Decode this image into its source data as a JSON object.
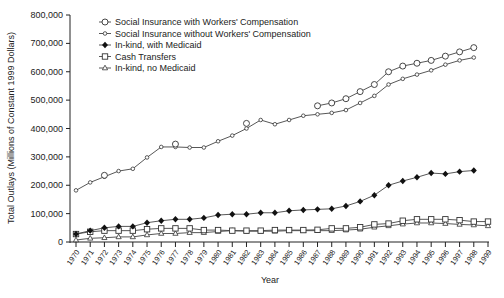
{
  "chart_data": {
    "type": "line",
    "title": "",
    "xlabel": "Year",
    "ylabel": "Total Outlays (Millions of Constant 1999 Dollars)",
    "ylim": [
      0,
      800000
    ],
    "yticks": [
      0,
      100000,
      200000,
      300000,
      400000,
      500000,
      600000,
      700000,
      800000
    ],
    "ytick_labels": [
      "0",
      "100,000",
      "200,000",
      "300,000",
      "400,000",
      "500,000",
      "600,000",
      "700,000",
      "800,000"
    ],
    "x": [
      1970,
      1971,
      1972,
      1973,
      1974,
      1975,
      1976,
      1977,
      1978,
      1979,
      1980,
      1981,
      1982,
      1983,
      1984,
      1985,
      1986,
      1987,
      1988,
      1989,
      1990,
      1991,
      1992,
      1993,
      1994,
      1995,
      1996,
      1997,
      1998,
      1999
    ],
    "grid": false,
    "legend_position": "upper-left",
    "series": [
      {
        "name": "Social Insurance with Workers' Compensation",
        "marker": "large-circle",
        "values": [
          null,
          null,
          235000,
          null,
          null,
          null,
          null,
          345000,
          null,
          null,
          null,
          null,
          418000,
          null,
          null,
          null,
          null,
          480000,
          490000,
          505000,
          530000,
          555000,
          600000,
          620000,
          630000,
          640000,
          655000,
          670000,
          685000,
          null
        ]
      },
      {
        "name": "Social Insurance without Workers' Compensation",
        "marker": "small-diamond",
        "values": [
          182000,
          210000,
          230000,
          250000,
          258000,
          298000,
          335000,
          335000,
          333000,
          333000,
          355000,
          375000,
          400000,
          430000,
          415000,
          430000,
          445000,
          450000,
          455000,
          465000,
          490000,
          515000,
          555000,
          575000,
          590000,
          605000,
          625000,
          640000,
          650000,
          null
        ]
      },
      {
        "name": "In-kind, with Medicaid",
        "marker": "filled-diamond",
        "values": [
          28000,
          40000,
          50000,
          55000,
          55000,
          68000,
          75000,
          80000,
          80000,
          85000,
          95000,
          98000,
          98000,
          103000,
          103000,
          110000,
          113000,
          115000,
          117000,
          127000,
          143000,
          165000,
          200000,
          215000,
          228000,
          243000,
          240000,
          248000,
          252000,
          null
        ]
      },
      {
        "name": "Cash Transfers",
        "marker": "square",
        "values": [
          28000,
          36000,
          40000,
          40000,
          40000,
          45000,
          48000,
          48000,
          48000,
          42000,
          42000,
          40000,
          40000,
          40000,
          42000,
          42000,
          42000,
          43000,
          48000,
          48000,
          52000,
          62000,
          65000,
          75000,
          80000,
          80000,
          80000,
          77000,
          72000,
          72000
        ]
      },
      {
        "name": "In-kind, no Medicaid",
        "marker": "triangle",
        "values": [
          7000,
          13000,
          15000,
          18000,
          18000,
          25000,
          30000,
          30000,
          33000,
          33000,
          37000,
          40000,
          38000,
          38000,
          38000,
          40000,
          40000,
          40000,
          40000,
          42000,
          45000,
          52000,
          57000,
          63000,
          67000,
          67000,
          65000,
          62000,
          60000,
          57000
        ]
      }
    ]
  },
  "legend": [
    {
      "label": "Social Insurance with Workers' Compensation"
    },
    {
      "label": "Social Insurance without Workers' Compensation"
    },
    {
      "label": "In-kind, with Medicaid"
    },
    {
      "label": "Cash Transfers"
    },
    {
      "label": "In-kind, no Medicaid"
    }
  ]
}
